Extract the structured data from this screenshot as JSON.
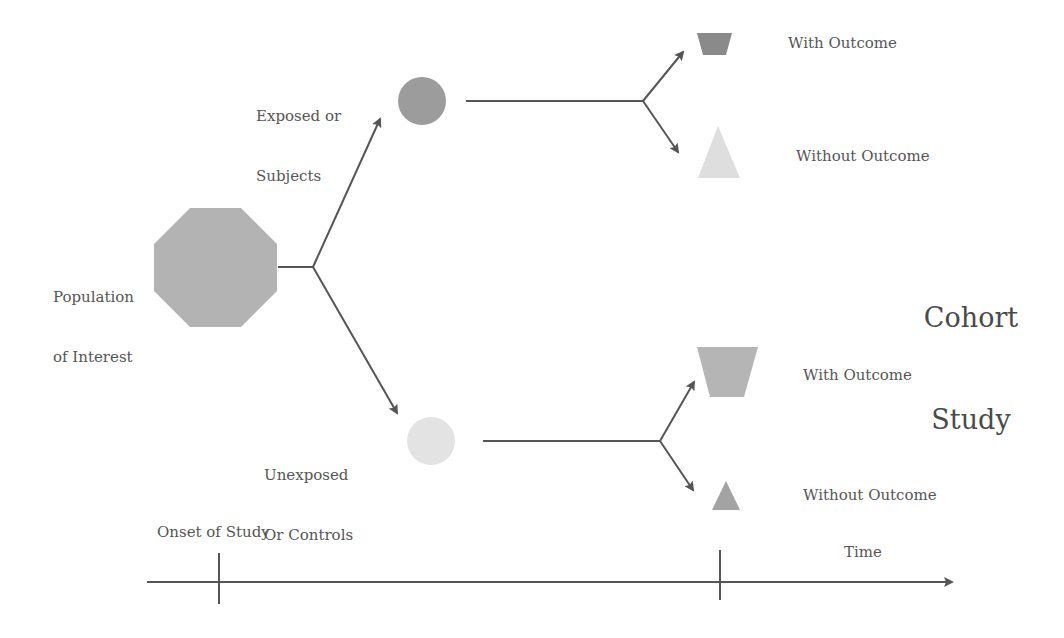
{
  "title": {
    "line1": "Cohort",
    "line2": "Study"
  },
  "population": {
    "line1": "Population",
    "line2": "of Interest",
    "color": "#b3b3b3"
  },
  "exposed": {
    "line1": "Exposed or",
    "line2": "Subjects",
    "color": "#9c9c9c"
  },
  "unexposed": {
    "line1": "Unexposed",
    "line2": "Or Controls",
    "color": "#e3e3e3"
  },
  "exposed_outcomes": {
    "with": {
      "label": "With Outcome",
      "color": "#8a8a8a"
    },
    "without": {
      "label": "Without Outcome",
      "color": "#dedede"
    }
  },
  "unexposed_outcomes": {
    "with": {
      "label": "With Outcome",
      "color": "#b5b5b5"
    },
    "without": {
      "label": "Without Outcome",
      "color": "#a3a3a3"
    }
  },
  "timeline": {
    "start_label": "Onset of Study",
    "end_label": "Time"
  },
  "colors": {
    "line": "#555555",
    "text": "#555555"
  }
}
